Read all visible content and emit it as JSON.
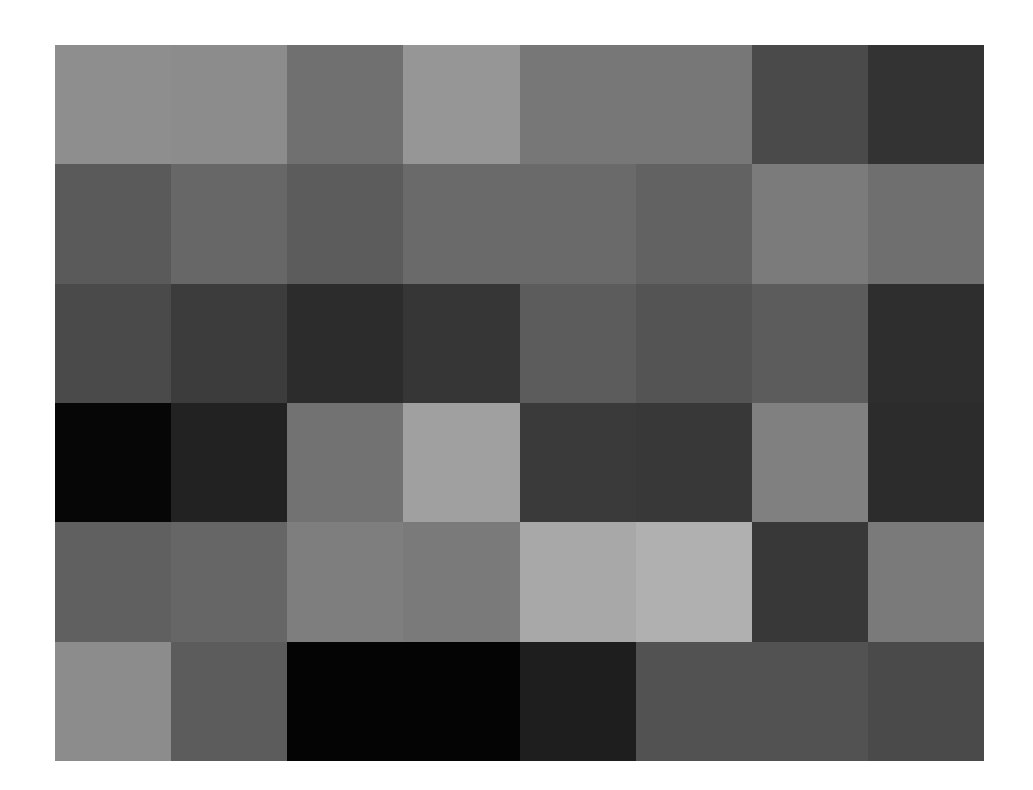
{
  "grid": {
    "rows": 6,
    "cols": 8,
    "cells": [
      [
        "#8e8e8e",
        "#8c8c8c",
        "#707070",
        "#969696",
        "#777777",
        "#777777",
        "#4a4a4a",
        "#333333"
      ],
      [
        "#5a5a5a",
        "#676767",
        "#5c5c5c",
        "#6a6a6a",
        "#6a6a6a",
        "#626262",
        "#7b7b7b",
        "#6f6f6f"
      ],
      [
        "#4a4a4a",
        "#3c3c3c",
        "#2c2c2c",
        "#363636",
        "#5c5c5c",
        "#545454",
        "#5c5c5c",
        "#2e2e2e"
      ],
      [
        "#060606",
        "#222222",
        "#727272",
        "#a0a0a0",
        "#3a3a3a",
        "#383838",
        "#808080",
        "#2c2c2c"
      ],
      [
        "#606060",
        "#666666",
        "#7e7e7e",
        "#7a7a7a",
        "#a8a8a8",
        "#b0b0b0",
        "#383838",
        "#7a7a7a"
      ],
      [
        "#8c8c8c",
        "#5c5c5c",
        "#040404",
        "#040404",
        "#1e1e1e",
        "#525252",
        "#525252",
        "#4a4a4a"
      ]
    ]
  }
}
